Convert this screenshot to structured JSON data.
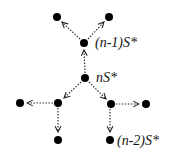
{
  "diagram": {
    "nodes": [
      {
        "id": "top-left",
        "x": 57,
        "y": 17
      },
      {
        "id": "top-right",
        "x": 109,
        "y": 17
      },
      {
        "id": "n-minus-1",
        "x": 84,
        "y": 43,
        "label": "(n-1)S*"
      },
      {
        "id": "n",
        "x": 85,
        "y": 78,
        "label": "nS*"
      },
      {
        "id": "left-mid",
        "x": 58,
        "y": 103
      },
      {
        "id": "far-left",
        "x": 20,
        "y": 103
      },
      {
        "id": "right-mid",
        "x": 111,
        "y": 104
      },
      {
        "id": "far-right",
        "x": 146,
        "y": 104
      },
      {
        "id": "bottom-left",
        "x": 58,
        "y": 140
      },
      {
        "id": "bottom-right",
        "x": 110,
        "y": 140,
        "label": "(n-2)S*"
      }
    ],
    "edges": [
      {
        "from": "n",
        "to": "n-minus-1",
        "style": "dotted-arrow"
      },
      {
        "from": "n-minus-1",
        "to": "top-left",
        "style": "dotted-arrow"
      },
      {
        "from": "n-minus-1",
        "to": "top-right",
        "style": "dotted-arrow"
      },
      {
        "from": "n",
        "to": "left-mid",
        "style": "dotted-arrow"
      },
      {
        "from": "n",
        "to": "right-mid",
        "style": "dotted-arrow"
      },
      {
        "from": "left-mid",
        "to": "far-left",
        "style": "dotted-arrow"
      },
      {
        "from": "left-mid",
        "to": "bottom-left",
        "style": "dotted-arrow"
      },
      {
        "from": "right-mid",
        "to": "far-right",
        "style": "dotted-arrow"
      },
      {
        "from": "right-mid",
        "to": "bottom-right",
        "style": "dotted-arrow"
      }
    ],
    "labels": {
      "n_minus_1": "(n-1)S*",
      "n": "nS*",
      "n_minus_2": "(n-2)S*"
    }
  }
}
